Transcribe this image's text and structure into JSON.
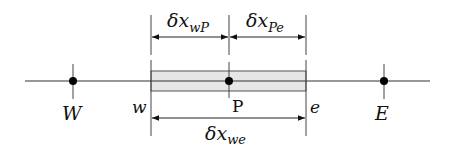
{
  "diagram": {
    "colors": {
      "line": "#333333",
      "node": "#000000",
      "control_volume_fill": "#e6e6e6",
      "control_volume_stroke": "#555555"
    },
    "nodes": [
      {
        "id": "W",
        "label": "W",
        "italic": true
      },
      {
        "id": "P",
        "label": "P",
        "italic": false
      },
      {
        "id": "E",
        "label": "E",
        "italic": true
      }
    ],
    "faces": [
      {
        "id": "w",
        "label": "w"
      },
      {
        "id": "e",
        "label": "e"
      }
    ],
    "dimensions": {
      "wP": {
        "symbol": "δx",
        "subscript": "wP"
      },
      "Pe": {
        "symbol": "δx",
        "subscript": "Pe"
      },
      "we": {
        "symbol": "δx",
        "subscript": "we"
      }
    }
  }
}
